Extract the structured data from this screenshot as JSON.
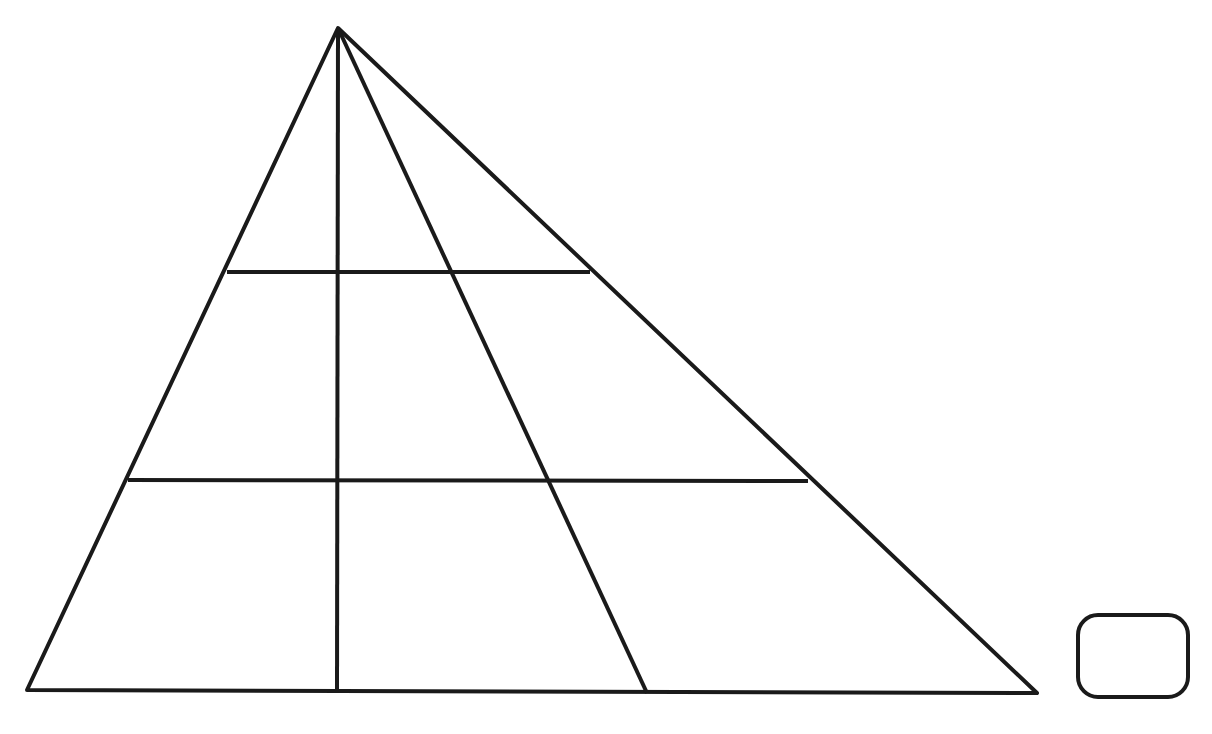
{
  "canvas": {
    "width": 1212,
    "height": 734,
    "background_color": "#ffffff",
    "ink_color": "#1a1a1a"
  },
  "figure": {
    "stroke_color": "#1a1a1a",
    "stroke_width": 4,
    "points": {
      "apex": {
        "x": 338,
        "y": 28
      },
      "base_left": {
        "x": 27,
        "y": 690
      },
      "base_right": {
        "x": 1037,
        "y": 693
      },
      "vertical_foot": {
        "x": 337,
        "y": 692
      },
      "cevian_foot": {
        "x": 647,
        "y": 693
      },
      "upper_chord_left": {
        "x": 227,
        "y": 272
      },
      "upper_chord_right": {
        "x": 590,
        "y": 272
      },
      "lower_chord_left": {
        "x": 128,
        "y": 480
      },
      "lower_chord_right": {
        "x": 808,
        "y": 481
      }
    },
    "shapes": [
      {
        "name": "triangle-outline",
        "type": "polygon",
        "label": "Outer triangle",
        "points": "338,28 1037,693 27,690"
      },
      {
        "name": "median-line",
        "type": "line",
        "label": "Vertical line from apex to base",
        "x1": 338,
        "y1": 28,
        "x2": 337,
        "y2": 692
      },
      {
        "name": "cevian-line",
        "type": "line",
        "label": "Oblique line from apex to base",
        "x1": 338,
        "y1": 28,
        "x2": 647,
        "y2": 693
      },
      {
        "name": "upper-chord-line",
        "type": "line",
        "label": "Upper horizontal chord",
        "x1": 227,
        "y1": 272,
        "x2": 590,
        "y2": 272
      },
      {
        "name": "lower-chord-line",
        "type": "line",
        "label": "Lower horizontal chord",
        "x1": 128,
        "y1": 480,
        "x2": 808,
        "y2": 481
      }
    ],
    "rounded_square": {
      "name": "rounded-square",
      "label": "Rounded square marker",
      "x": 1078,
      "y": 615,
      "width": 110,
      "height": 82,
      "corner_radius": 20,
      "stroke_width": 4
    }
  }
}
